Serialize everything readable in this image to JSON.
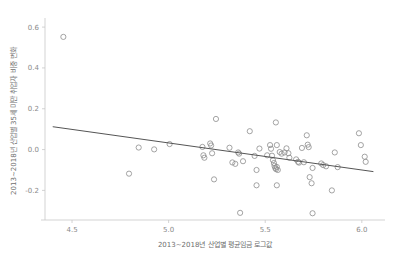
{
  "chart_data": {
    "type": "scatter",
    "title": "",
    "subtitle": "",
    "xlabel": "2013~2018년 산업별 평균임금 로그값",
    "ylabel": "2013~2018년 산업별 35세 미만 취업자 비중 변화",
    "xlim": [
      4.36,
      6.12
    ],
    "ylim": [
      -0.345,
      0.625
    ],
    "xticks": [
      4.5,
      5.0,
      5.5,
      6.0
    ],
    "xtick_labels": [
      "4.5",
      "5.0",
      "5.5",
      "6.0"
    ],
    "yticks": [
      0.6,
      0.4,
      0.2,
      0.0,
      -0.2
    ],
    "ytick_labels": [
      "0.6",
      "0.4",
      "0.2",
      "0.0",
      "-0.2"
    ],
    "grid": false,
    "legend": "none",
    "marker": {
      "shape": "open-circle",
      "radius_px": 2.6,
      "stroke_color": "#8d8d8d",
      "fill": "none"
    },
    "trendline": {
      "type": "linear-fit",
      "color": "#555555",
      "x_start": 4.4,
      "y_start": 0.112,
      "x_end": 6.06,
      "y_end": -0.108
    },
    "points": [
      {
        "x": 4.455,
        "y": 0.552
      },
      {
        "x": 4.845,
        "y": 0.01
      },
      {
        "x": 4.795,
        "y": -0.118
      },
      {
        "x": 4.925,
        "y": 0.001
      },
      {
        "x": 5.005,
        "y": 0.027
      },
      {
        "x": 5.175,
        "y": 0.013
      },
      {
        "x": 5.18,
        "y": -0.028
      },
      {
        "x": 5.185,
        "y": -0.04
      },
      {
        "x": 5.215,
        "y": 0.03
      },
      {
        "x": 5.22,
        "y": 0.02
      },
      {
        "x": 5.225,
        "y": -0.018
      },
      {
        "x": 5.245,
        "y": 0.15
      },
      {
        "x": 5.235,
        "y": -0.146
      },
      {
        "x": 5.315,
        "y": 0.009
      },
      {
        "x": 5.33,
        "y": -0.063
      },
      {
        "x": 5.345,
        "y": -0.07
      },
      {
        "x": 5.36,
        "y": -0.014
      },
      {
        "x": 5.365,
        "y": -0.02
      },
      {
        "x": 5.385,
        "y": -0.057
      },
      {
        "x": 5.37,
        "y": -0.31
      },
      {
        "x": 5.42,
        "y": 0.09
      },
      {
        "x": 5.445,
        "y": -0.031
      },
      {
        "x": 5.455,
        "y": -0.1
      },
      {
        "x": 5.455,
        "y": -0.175
      },
      {
        "x": 5.47,
        "y": 0.005
      },
      {
        "x": 5.51,
        "y": -0.028
      },
      {
        "x": 5.525,
        "y": 0.022
      },
      {
        "x": 5.53,
        "y": 0.004
      },
      {
        "x": 5.535,
        "y": -0.03
      },
      {
        "x": 5.54,
        "y": -0.052
      },
      {
        "x": 5.545,
        "y": -0.066
      },
      {
        "x": 5.548,
        "y": -0.08
      },
      {
        "x": 5.552,
        "y": -0.09
      },
      {
        "x": 5.556,
        "y": -0.096
      },
      {
        "x": 5.56,
        "y": -0.085
      },
      {
        "x": 5.565,
        "y": -0.1
      },
      {
        "x": 5.555,
        "y": 0.133
      },
      {
        "x": 5.56,
        "y": 0.022
      },
      {
        "x": 5.575,
        "y": -0.012
      },
      {
        "x": 5.585,
        "y": -0.02
      },
      {
        "x": 5.56,
        "y": -0.175
      },
      {
        "x": 5.6,
        "y": -0.014
      },
      {
        "x": 5.61,
        "y": 0.006
      },
      {
        "x": 5.62,
        "y": -0.018
      },
      {
        "x": 5.625,
        "y": -0.04
      },
      {
        "x": 5.66,
        "y": -0.048
      },
      {
        "x": 5.67,
        "y": -0.06
      },
      {
        "x": 5.675,
        "y": -0.064
      },
      {
        "x": 5.69,
        "y": 0.008
      },
      {
        "x": 5.7,
        "y": -0.062
      },
      {
        "x": 5.715,
        "y": 0.07
      },
      {
        "x": 5.72,
        "y": 0.024
      },
      {
        "x": 5.725,
        "y": 0.012
      },
      {
        "x": 5.73,
        "y": -0.135
      },
      {
        "x": 5.74,
        "y": -0.165
      },
      {
        "x": 5.745,
        "y": -0.09
      },
      {
        "x": 5.745,
        "y": -0.312
      },
      {
        "x": 5.79,
        "y": -0.068
      },
      {
        "x": 5.8,
        "y": -0.076
      },
      {
        "x": 5.815,
        "y": -0.082
      },
      {
        "x": 5.845,
        "y": -0.2
      },
      {
        "x": 5.86,
        "y": -0.014
      },
      {
        "x": 5.875,
        "y": -0.086
      },
      {
        "x": 5.985,
        "y": 0.08
      },
      {
        "x": 5.995,
        "y": 0.022
      },
      {
        "x": 6.015,
        "y": -0.035
      },
      {
        "x": 6.02,
        "y": -0.06
      }
    ]
  }
}
